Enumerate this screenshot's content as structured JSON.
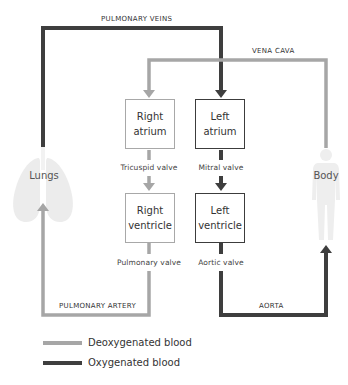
{
  "colors": {
    "deoxygenated": "#a6a6a6",
    "oxygenated": "#3e3e3e",
    "organ_fill": "#ececec"
  },
  "vessels": {
    "pulmonary_veins": "PULMONARY VEINS",
    "vena_cava": "VENA CAVA",
    "pulmonary_artery": "PULMONARY ARTERY",
    "aorta": "AORTA"
  },
  "chambers": {
    "right_atrium": [
      "Right",
      "atrium"
    ],
    "left_atrium": [
      "Left",
      "atrium"
    ],
    "right_ventricle": [
      "Right",
      "ventricle"
    ],
    "left_ventricle": [
      "Left",
      "ventricle"
    ]
  },
  "valves": {
    "tricuspid": "Tricuspid valve",
    "mitral": "Mitral valve",
    "pulmonary": "Pulmonary valve",
    "aortic": "Aortic valve"
  },
  "organs": {
    "lungs": "Lungs",
    "body": "Body"
  },
  "legend": [
    {
      "label": "Deoxygenated blood",
      "color": "#a6a6a6"
    },
    {
      "label": "Oxygenated blood",
      "color": "#3e3e3e"
    }
  ]
}
